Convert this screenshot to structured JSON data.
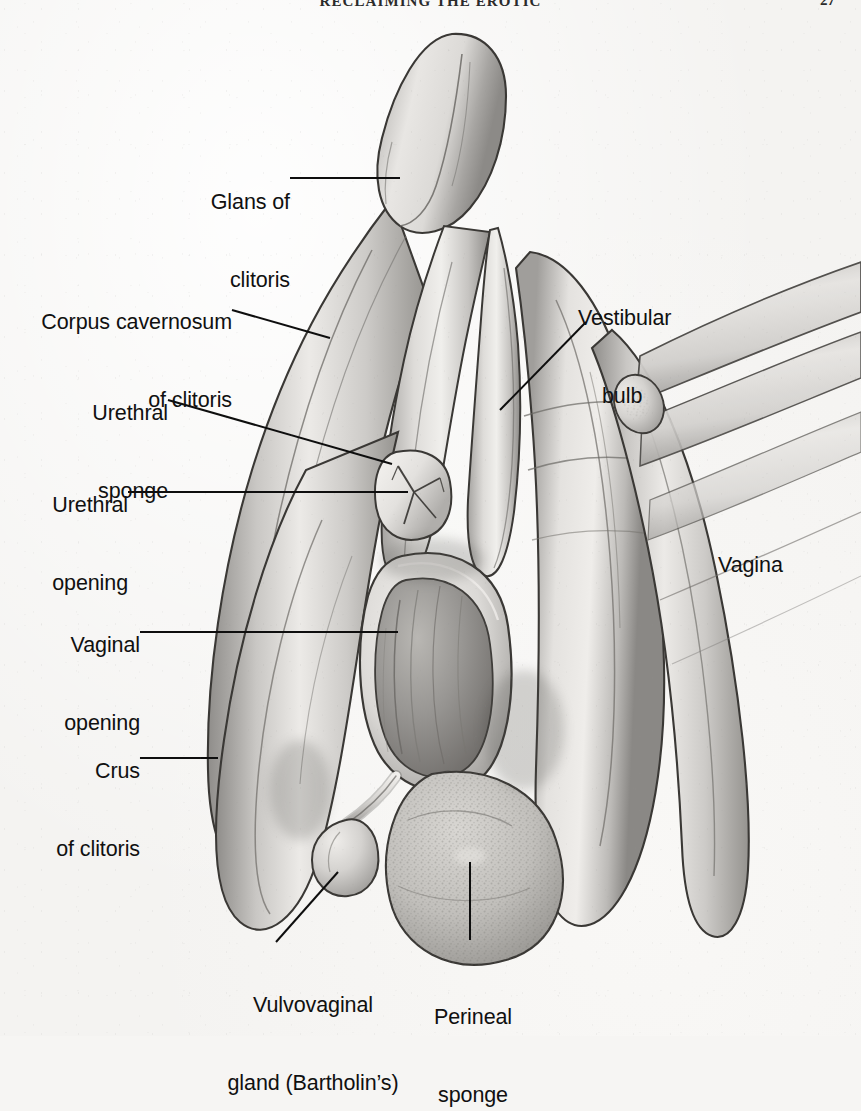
{
  "page": {
    "running_head": "RECLAIMING THE EROTIC",
    "folio": "27",
    "background_color": "#f4f3f1",
    "ink_color": "#101010"
  },
  "figure": {
    "name": "internal-clitoral-anatomy-diagram",
    "type": "anatomical-illustration",
    "style": "grayscale-pencil-rendering",
    "structures": [
      {
        "id": "glans-of-clitoris",
        "name": "Glans of clitoris"
      },
      {
        "id": "corpus-cavernosum",
        "name": "Corpus cavernosum of clitoris"
      },
      {
        "id": "urethral-sponge",
        "name": "Urethral sponge"
      },
      {
        "id": "urethral-opening",
        "name": "Urethral opening"
      },
      {
        "id": "vaginal-opening",
        "name": "Vaginal opening"
      },
      {
        "id": "crus-of-clitoris",
        "name": "Crus of clitoris"
      },
      {
        "id": "vestibular-bulb",
        "name": "Vestibular bulb"
      },
      {
        "id": "vagina",
        "name": "Vagina"
      },
      {
        "id": "vulvovaginal-gland",
        "name": "Vulvovaginal gland (Bartholin's)"
      },
      {
        "id": "perineal-sponge",
        "name": "Perineal sponge"
      }
    ]
  },
  "labels": {
    "glans": {
      "line1": "Glans of",
      "line2": "clitoris"
    },
    "corpus": {
      "line1": "Corpus cavernosum",
      "line2": "of clitoris"
    },
    "ureth_sponge": {
      "line1": "Urethral",
      "line2": "sponge"
    },
    "ureth_open": {
      "line1": "Urethral",
      "line2": "opening"
    },
    "vag_open": {
      "line1": "Vaginal",
      "line2": "opening"
    },
    "crus": {
      "line1": "Crus",
      "line2": "of clitoris"
    },
    "vestibular": {
      "line1": "Vestibular",
      "line2": "bulb"
    },
    "vagina": {
      "line1": "Vagina",
      "line2": ""
    },
    "bartholin": {
      "line1": "Vulvovaginal",
      "line2": "gland (Bartholin’s)"
    },
    "perineal": {
      "line1": "Perineal",
      "line2": "sponge"
    }
  }
}
